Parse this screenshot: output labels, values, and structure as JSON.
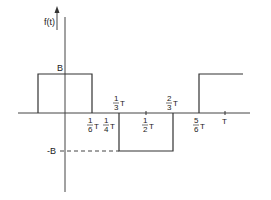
{
  "diagram": {
    "y_axis_label": "f(t)",
    "levels": {
      "high": "B",
      "low": "-B"
    },
    "period": "T",
    "x_tick_labels": [
      {
        "num": "1",
        "den": "6",
        "unit": "T"
      },
      {
        "num": "1",
        "den": "4",
        "unit": "T"
      },
      {
        "num": "1",
        "den": "3",
        "unit": "T"
      },
      {
        "num": "1",
        "den": "2",
        "unit": "T"
      },
      {
        "num": "2",
        "den": "3",
        "unit": "T"
      },
      {
        "num": "5",
        "den": "6",
        "unit": "T"
      },
      {
        "num": "",
        "den": "",
        "unit": "T"
      }
    ],
    "waveform": [
      {
        "from": "-1/6 T",
        "to": "1/6 T",
        "level": "B"
      },
      {
        "from": "1/6 T",
        "to": "1/3 T",
        "level": "0"
      },
      {
        "from": "1/3 T",
        "to": "2/3 T",
        "level": "-B"
      },
      {
        "from": "2/3 T",
        "to": "5/6 T",
        "level": "0"
      },
      {
        "from": "5/6 T",
        "to": "7/6 T",
        "level": "B"
      }
    ]
  }
}
